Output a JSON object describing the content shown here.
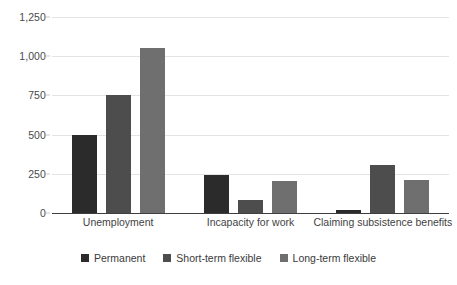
{
  "chart_data": {
    "type": "bar",
    "title": "",
    "subtitle": "",
    "xlabel": "",
    "ylabel": "",
    "categories": [
      "Unemployment",
      "Incapacity for work",
      "Claiming subsistence benefits"
    ],
    "series": [
      {
        "name": "Permanent",
        "color": "#2b2b2b",
        "values": [
          500,
          240,
          20
        ]
      },
      {
        "name": "Short-term flexible",
        "color": "#4d4d4d",
        "values": [
          750,
          80,
          305
        ]
      },
      {
        "name": "Long-term flexible",
        "color": "#6f6f6f",
        "values": [
          1055,
          205,
          210
        ]
      }
    ],
    "ylim": [
      0,
      1250
    ],
    "yticks": [
      0,
      250,
      500,
      750,
      1000,
      1250
    ],
    "ytick_labels": [
      "0",
      "250",
      "500",
      "750",
      "1,000",
      "1,250"
    ],
    "grid": true,
    "legend_position": "bottom",
    "gridline_color": "#e3e3e3",
    "axis_color": "#3f3f3f",
    "background": "#ffffff"
  }
}
